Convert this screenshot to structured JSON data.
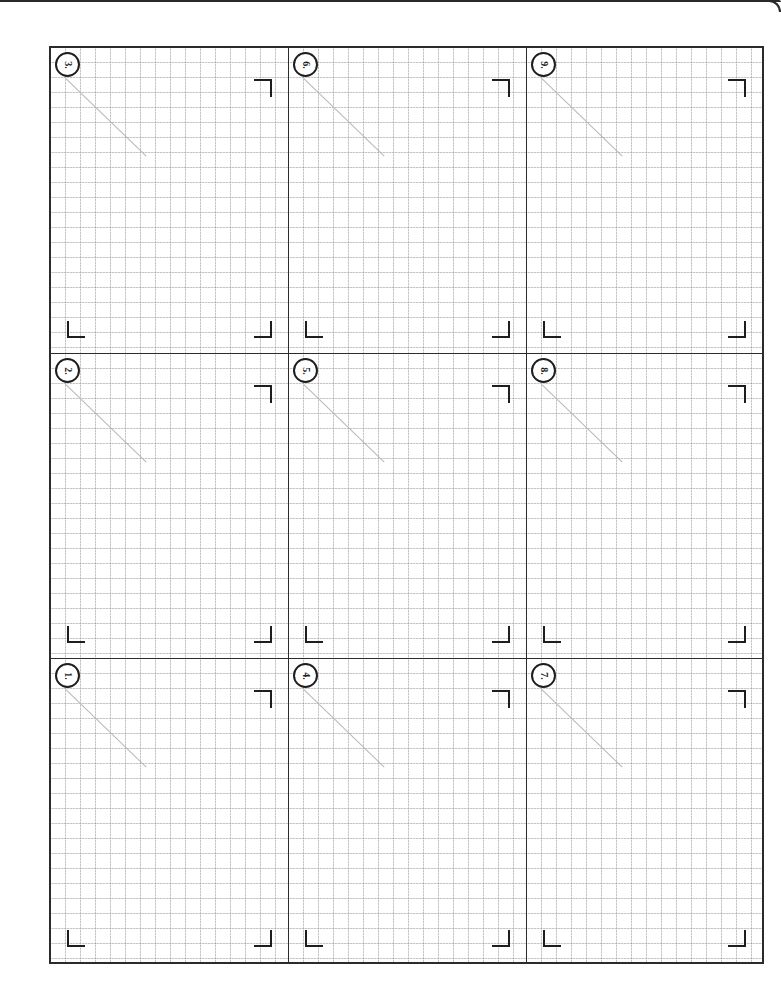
{
  "page": {
    "type": "graph-paper worksheet",
    "layout": {
      "rows": 3,
      "columns": 3
    },
    "colors": {
      "frame": "#2b2b2b",
      "grid": "#969696",
      "diagonal": "#b8b8b8",
      "marks": "#1e1e1e"
    }
  },
  "cells": [
    {
      "label": "3.",
      "row": 1,
      "col": 1
    },
    {
      "label": "6.",
      "row": 1,
      "col": 2
    },
    {
      "label": "9.",
      "row": 1,
      "col": 3
    },
    {
      "label": "2.",
      "row": 2,
      "col": 1
    },
    {
      "label": "5.",
      "row": 2,
      "col": 2
    },
    {
      "label": "8.",
      "row": 2,
      "col": 3
    },
    {
      "label": "1.",
      "row": 3,
      "col": 1
    },
    {
      "label": "4.",
      "row": 3,
      "col": 2
    },
    {
      "label": "7.",
      "row": 3,
      "col": 3
    }
  ]
}
